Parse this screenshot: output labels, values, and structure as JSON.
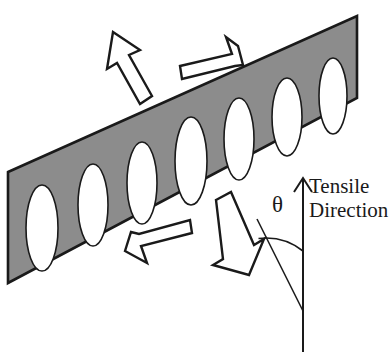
{
  "figure": {
    "background_color": "#ffffff",
    "width": 391,
    "height": 352
  },
  "band": {
    "name": "shear-band",
    "fill_color": "#8c8c8c",
    "stroke_color": "#1a1a1a",
    "orientation_note": "inclined band running from lower-left to upper-right",
    "inclination_degrees": 21,
    "corners": [
      [
        8,
        172
      ],
      [
        357,
        16
      ],
      [
        357,
        98
      ],
      [
        8,
        283
      ]
    ]
  },
  "voids": {
    "name": "elliptical-voids",
    "count": 7,
    "fill_color": "#ffffff",
    "stroke_color": "#1a1a1a",
    "shape": "vertical ellipse",
    "items": [
      {
        "cx": 42,
        "cy": 228,
        "rx": 16,
        "ry": 43
      },
      {
        "cx": 93,
        "cy": 205,
        "rx": 15,
        "ry": 41
      },
      {
        "cx": 142,
        "cy": 183,
        "rx": 15,
        "ry": 41
      },
      {
        "cx": 191,
        "cy": 161,
        "rx": 16,
        "ry": 44
      },
      {
        "cx": 239,
        "cy": 139,
        "rx": 15,
        "ry": 41
      },
      {
        "cx": 287,
        "cy": 117,
        "rx": 15,
        "ry": 39
      },
      {
        "cx": 333,
        "cy": 96,
        "rx": 14,
        "ry": 38
      }
    ]
  },
  "arrows": [
    {
      "name": "arrow-up-left",
      "label": "tensile-arrow-upper-left",
      "direction": "up-left",
      "style": "hollow outlined block arrow",
      "fill_color": "#ffffff",
      "stroke_color": "#1a1a1a"
    },
    {
      "name": "arrow-up-right",
      "label": "shear-arrow-upper-right",
      "direction": "up-right along band",
      "style": "hollow outlined block arrow",
      "fill_color": "#ffffff",
      "stroke_color": "#1a1a1a"
    },
    {
      "name": "arrow-down-left",
      "label": "shear-arrow-lower-left",
      "direction": "down-left along band",
      "style": "hollow outlined block arrow",
      "fill_color": "#ffffff",
      "stroke_color": "#1a1a1a"
    },
    {
      "name": "arrow-down-right",
      "label": "tensile-arrow-lower-right",
      "direction": "down-right",
      "style": "hollow outlined block arrow",
      "fill_color": "#ffffff",
      "stroke_color": "#1a1a1a"
    }
  ],
  "annotation": {
    "tensile_direction_line1": "Tensile",
    "tensile_direction_line2": "Direction",
    "angle_symbol": "θ",
    "axis": {
      "name": "tensile-direction-axis",
      "stroke_color": "#1a1a1a",
      "tip": [
        303,
        178
      ],
      "base": [
        303,
        352
      ]
    },
    "reference_line": {
      "name": "band-normal-reference-line",
      "stroke_color": "#1a1a1a",
      "from": [
        258,
        220
      ],
      "to": [
        303,
        310
      ]
    },
    "arc": {
      "name": "angle-arc",
      "stroke_color": "#1a1a1a",
      "radius": 60
    }
  }
}
